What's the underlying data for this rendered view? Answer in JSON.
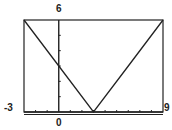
{
  "chart_data": {
    "type": "line",
    "title": "",
    "function": "y = |x - 3|",
    "xlabel": "",
    "ylabel": "",
    "xlim": [
      -3,
      9
    ],
    "ylim": [
      0,
      6
    ],
    "grid": false,
    "x_ticks_step": 1,
    "y_ticks_step": 1,
    "tick_labels": {
      "xmin": "-3",
      "xmax": "9",
      "ymax": "6",
      "x_origin": "0"
    },
    "series": [
      {
        "name": "y = |x - 3|",
        "x": [
          -3,
          0,
          3,
          6,
          9
        ],
        "y": [
          6,
          3,
          0,
          3,
          6
        ]
      }
    ],
    "vertex": [
      3,
      0
    ]
  },
  "colors": {
    "line": "#222222",
    "frame": "#222222",
    "background": "#ffffff"
  }
}
